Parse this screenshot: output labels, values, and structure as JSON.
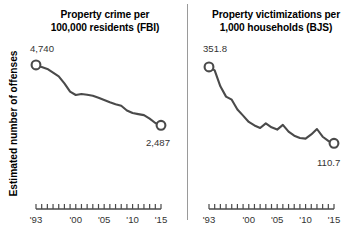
{
  "figure": {
    "background_color": "#ffffff",
    "line_color": "#4a4a4a",
    "text_color": "#000000",
    "divider_color": "#9a9a9a",
    "shared_ylabel": "Estimated number of offenses"
  },
  "axis": {
    "tick_labels": [
      "'93",
      "'00",
      "'05",
      "'10",
      "'15"
    ],
    "tick_years": [
      1993,
      2000,
      2005,
      2010,
      2015
    ],
    "minor_tick_interval_years": 1,
    "x_range": [
      1993,
      2015
    ]
  },
  "chart_data": [
    {
      "type": "line",
      "panel": "left",
      "title": "Property crime per 100,000 residents (FBI)",
      "title_line1": "Property crime per",
      "title_line2": "100,000 residents (FBI)",
      "source": "FBI",
      "xlabel": "",
      "ylabel": "Estimated number of offenses",
      "xlim": [
        1993,
        2015
      ],
      "ylim": [
        2200,
        5000
      ],
      "grid": false,
      "legend": "none",
      "start_label": "4,740",
      "end_label": "2,487",
      "start_value": 4740,
      "end_value": 2487,
      "x": [
        1993,
        1994,
        1995,
        1996,
        1997,
        1998,
        1999,
        2000,
        2001,
        2002,
        2003,
        2004,
        2005,
        2006,
        2007,
        2008,
        2009,
        2010,
        2011,
        2012,
        2013,
        2014,
        2015
      ],
      "values": [
        4740,
        4660,
        4591,
        4451,
        4316,
        4053,
        3744,
        3618,
        3658,
        3631,
        3591,
        3514,
        3431,
        3347,
        3276,
        3215,
        3041,
        2946,
        2905,
        2868,
        2734,
        2574,
        2487
      ]
    },
    {
      "type": "line",
      "panel": "right",
      "title": "Property victimizations per 1,000 households (BJS)",
      "title_line1": "Property victimizations per",
      "title_line2": "1,000 households (BJS)",
      "source": "BJS",
      "xlabel": "",
      "ylabel": "Estimated number of offenses",
      "xlim": [
        1993,
        2015
      ],
      "ylim": [
        80,
        380
      ],
      "grid": false,
      "legend": "none",
      "start_label": "351.8",
      "end_label": "110.7",
      "start_value": 351.8,
      "end_value": 110.7,
      "x": [
        1993,
        1994,
        1995,
        1996,
        1997,
        1998,
        1999,
        2000,
        2001,
        2002,
        2003,
        2004,
        2005,
        2006,
        2007,
        2008,
        2009,
        2010,
        2011,
        2012,
        2013,
        2014,
        2015
      ],
      "values": [
        351.8,
        341.0,
        290.5,
        258.0,
        248.3,
        217.4,
        198.0,
        178.1,
        166.9,
        159.0,
        173.4,
        161.1,
        154.0,
        169.0,
        147.3,
        134.7,
        127.4,
        125.4,
        138.7,
        155.8,
        131.4,
        118.1,
        110.7
      ]
    }
  ]
}
